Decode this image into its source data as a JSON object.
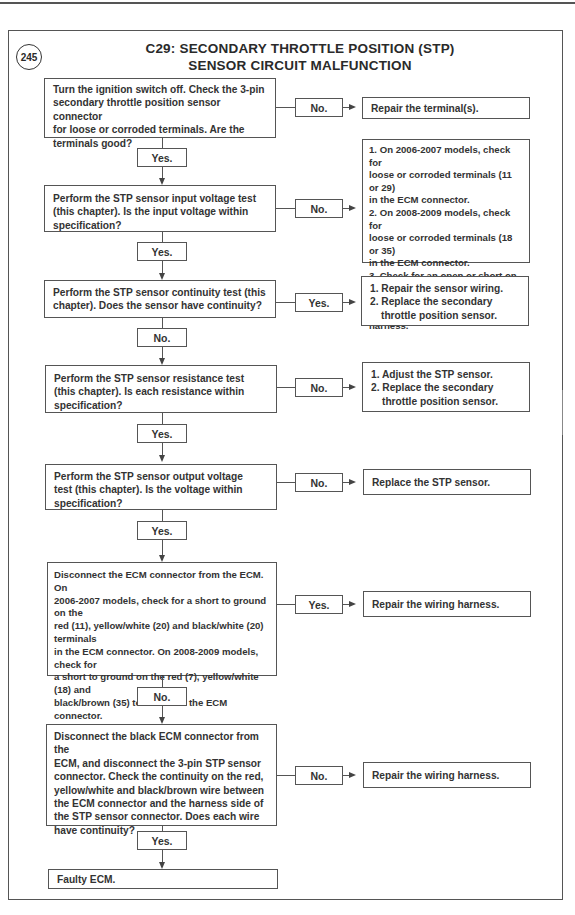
{
  "figure": {
    "number": "245",
    "title_line1": "C29: SECONDARY THROTTLE POSITION (STP)",
    "title_line2": "SENSOR CIRCUIT MALFUNCTION"
  },
  "steps": [
    {
      "lines": [
        "Turn the ignition switch off. Check the 3-pin",
        "secondary throttle position sensor connector",
        "for loose or corroded terminals. Are the",
        "terminals good?"
      ],
      "side_label": "No.",
      "side_result": [
        "Repair the terminal(s)."
      ],
      "down_label": "Yes."
    },
    {
      "lines": [
        "Perform the STP sensor input voltage test",
        "(this chapter). Is the input voltage within",
        "specification?"
      ],
      "side_label": "No.",
      "side_result": [
        "1. On 2006-2007 models, check for",
        "loose or corroded terminals (11 or 29)",
        "in the ECM connector.",
        "2. On 2008-2009 models, check for",
        "loose or corroded terminals (18 or 35)",
        "in the ECM connector.",
        "3. Check for an open or short on the",
        "dark red or black/brown wire in the",
        "harness."
      ],
      "down_label": "Yes."
    },
    {
      "lines": [
        "Perform the STP sensor continuity test (this",
        "chapter). Does the sensor have continuity?"
      ],
      "side_label": "Yes.",
      "side_result": [
        "1. Repair the sensor wiring.",
        "2. Replace the secondary",
        "throttle position sensor."
      ],
      "down_label": "No."
    },
    {
      "lines": [
        "Perform the STP sensor resistance test",
        "(this chapter). Is each resistance within",
        "specification?"
      ],
      "side_label": "No.",
      "side_result": [
        "1. Adjust the STP sensor.",
        "2. Replace the secondary",
        "throttle position sensor."
      ],
      "down_label": "Yes."
    },
    {
      "lines": [
        "Perform the STP sensor output voltage",
        "test (this chapter). Is the voltage within",
        "specification?"
      ],
      "side_label": "No.",
      "side_result": [
        "Replace the STP sensor."
      ],
      "down_label": "Yes."
    },
    {
      "lines": [
        "Disconnect the ECM connector from the ECM. On",
        "2006-2007 models, check for a short to ground on the",
        "red (11), yellow/white (20) and black/white (20) terminals",
        "in the ECM connector. On 2008-2009 models, check for",
        "a short to ground on the red (7), yellow/white (18) and",
        "black/brown (35) terminals in the ECM connector."
      ],
      "refer_prefix": "Refer to ",
      "refer_fig1": "Figure 229",
      "refer_mid": " or ",
      "refer_fig2": "Figure 230",
      "refer_suffix": ".  Are any wires",
      "last_line": "shorted to ground?",
      "side_label": "Yes.",
      "side_result": [
        "Repair the wiring harness."
      ],
      "down_label": "No."
    },
    {
      "lines": [
        "Disconnect the black ECM connector from the",
        "ECM, and disconnect the 3-pin STP sensor",
        "connector. Check the continuity on the red,",
        "yellow/white and black/brown wire between",
        "the ECM connector and the harness side of",
        "the STP sensor connector. Does each wire",
        "have continuity?"
      ],
      "side_label": "No.",
      "side_result": [
        "Repair the wiring harness."
      ],
      "down_label": "Yes."
    }
  ],
  "final_result": "Faulty ECM."
}
